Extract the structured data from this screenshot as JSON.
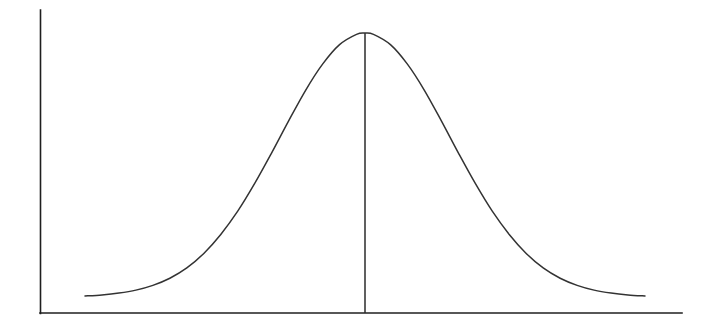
{
  "figure": {
    "title": "",
    "background_color": "#ffffff",
    "width": 711,
    "height": 328
  },
  "axes": {
    "y_axis": {
      "name": "vertical-axis",
      "label": "",
      "color": "#1f1f1f",
      "x": 40,
      "y_top": 10,
      "y_bottom": 313,
      "ticks": [],
      "tick_labels": []
    },
    "x_axis": {
      "name": "horizontal-axis",
      "label": "",
      "color": "#1f1f1f",
      "y": 313,
      "x_left": 40,
      "x_right": 682,
      "ticks": [],
      "tick_labels": []
    }
  },
  "mean_marker": {
    "name": "mean-line",
    "label": "",
    "color": "#2b2b2b",
    "x": 365,
    "y_top": 33,
    "y_bottom": 313
  },
  "curve": {
    "name": "normal-distribution-curve",
    "color": "#333333",
    "stroke_width": 1.5,
    "peak_x": 365,
    "peak_y": 33,
    "start_x": 85,
    "end_x": 645,
    "baseline_y": 297
  },
  "chart_data": {
    "type": "line",
    "title": "",
    "subtitle": "",
    "xlabel": "",
    "ylabel": "",
    "grid": false,
    "legend": [],
    "legend_position": "none",
    "distribution": "normal",
    "mean": 0,
    "sigma": 1,
    "peak_value": 1.0,
    "xlim": [
      -3.3,
      3.3
    ],
    "ylim": [
      0,
      1.05
    ],
    "xtick_labels": [],
    "ytick_labels": [],
    "annotations": [
      {
        "name": "mean-vertical-line",
        "type": "vline",
        "x": 0,
        "y_from": 0,
        "y_to": 1.0,
        "text": ""
      }
    ],
    "series": [
      {
        "name": "normal-density",
        "x": [
          -3.3,
          -3.1,
          -2.9,
          -2.7,
          -2.5,
          -2.3,
          -2.1,
          -1.9,
          -1.7,
          -1.5,
          -1.3,
          -1.1,
          -0.9,
          -0.7,
          -0.5,
          -0.3,
          -0.1,
          0.0,
          0.1,
          0.3,
          0.5,
          0.7,
          0.9,
          1.1,
          1.3,
          1.5,
          1.7,
          1.9,
          2.1,
          2.3,
          2.5,
          2.7,
          2.9,
          3.1,
          3.3
        ],
        "y": [
          0.004,
          0.008,
          0.015,
          0.026,
          0.044,
          0.071,
          0.11,
          0.165,
          0.237,
          0.325,
          0.43,
          0.546,
          0.667,
          0.783,
          0.882,
          0.956,
          0.995,
          1.0,
          0.995,
          0.956,
          0.882,
          0.783,
          0.667,
          0.546,
          0.43,
          0.325,
          0.237,
          0.165,
          0.11,
          0.071,
          0.044,
          0.026,
          0.015,
          0.008,
          0.004
        ]
      }
    ]
  }
}
